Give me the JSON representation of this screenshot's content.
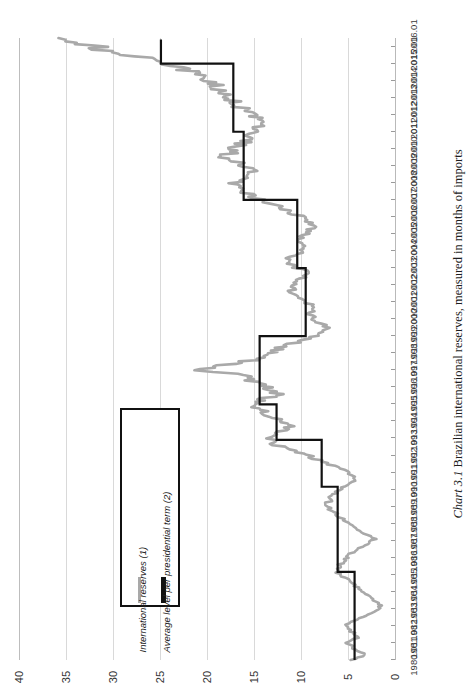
{
  "caption": {
    "label": "Chart 3.1",
    "text": "Brazilian international reserves, measured in months of imports"
  },
  "legend": {
    "position": "inside-left",
    "entries": [
      {
        "name": "International reserves (1)",
        "color": "#a9a9a9",
        "marker": "line-thin"
      },
      {
        "name": "Average level per presidential term (2)",
        "color": "#111111",
        "marker": "line-thick"
      }
    ]
  },
  "chart_data": {
    "type": "line",
    "title": "Brazilian international reserves, measured in months of imports",
    "orientation": "rotated-90ccw",
    "xlabel": "",
    "ylabel": "",
    "ylim": [
      0,
      40
    ],
    "yticks": [
      0,
      5,
      10,
      15,
      20,
      25,
      30,
      35,
      40
    ],
    "grid": "value-axis-gridlines-only",
    "xlim": [
      "1980.01",
      "2016.06"
    ],
    "xticks": [
      "1980.01",
      "1981.01",
      "1982.01",
      "1983.01",
      "1984.01",
      "1985.01",
      "1986.01",
      "1987.01",
      "1988.01",
      "1989.01",
      "1990.01",
      "1991.01",
      "1992.01",
      "1993.01",
      "1994.01",
      "1995.01",
      "1996.01",
      "1997.01",
      "1998.01",
      "1999.01",
      "2000.01",
      "2001.01",
      "2002.01",
      "2003.01",
      "2004.01",
      "2005.01",
      "2006.01",
      "2007.01",
      "2008.01",
      "2009.01",
      "2010.01",
      "2011.01",
      "2012.01",
      "2013.01",
      "2014.01",
      "2015.01",
      "2016.01"
    ],
    "series": [
      {
        "name": "International reserves (1)",
        "color": "#a9a9a9",
        "width": 2.6,
        "x": [
          1980.0,
          1980.3,
          1980.6,
          1981.0,
          1981.3,
          1981.6,
          1982.0,
          1982.3,
          1982.6,
          1982.9,
          1983.2,
          1983.5,
          1983.8,
          1984.1,
          1984.5,
          1984.9,
          1985.2,
          1985.6,
          1986.0,
          1986.4,
          1986.8,
          1987.1,
          1987.5,
          1987.9,
          1988.2,
          1988.6,
          1989.0,
          1989.4,
          1989.8,
          1990.2,
          1990.6,
          1991.0,
          1991.4,
          1991.8,
          1992.2,
          1992.6,
          1993.0,
          1993.4,
          1993.8,
          1994.2,
          1994.6,
          1995.0,
          1995.3,
          1995.6,
          1996.0,
          1996.4,
          1996.8,
          1997.0,
          1997.3,
          1997.6,
          1998.0,
          1998.4,
          1998.8,
          1999.1,
          1999.5,
          1999.9,
          2000.3,
          2000.7,
          2001.1,
          2001.5,
          2001.9,
          2002.3,
          2002.7,
          2003.1,
          2003.5,
          2003.9,
          2004.3,
          2004.7,
          2005.1,
          2005.5,
          2005.9,
          2006.3,
          2006.7,
          2007.1,
          2007.5,
          2007.9,
          2008.3,
          2008.7,
          2009.1,
          2009.5,
          2009.9,
          2010.3,
          2010.7,
          2011.1,
          2011.5,
          2011.9,
          2012.3,
          2012.7,
          2013.1,
          2013.5,
          2013.9,
          2014.3,
          2014.7,
          2015.1,
          2015.5,
          2015.9,
          2016.3,
          2016.5
        ],
        "y": [
          4.6,
          3.2,
          4.1,
          5.1,
          4.0,
          4.5,
          5.3,
          4.3,
          3.1,
          2.0,
          1.5,
          2.2,
          3.0,
          3.6,
          4.6,
          5.5,
          6.2,
          5.8,
          5.2,
          4.4,
          3.0,
          2.2,
          3.4,
          4.6,
          5.4,
          6.4,
          7.2,
          7.0,
          6.4,
          5.2,
          4.2,
          5.0,
          6.6,
          8.4,
          10.2,
          12.4,
          13.6,
          12.2,
          11.0,
          12.6,
          14.2,
          15.6,
          14.0,
          12.4,
          13.8,
          15.2,
          16.6,
          21.8,
          18.2,
          15.0,
          13.4,
          11.8,
          9.6,
          8.0,
          7.2,
          8.4,
          9.2,
          8.6,
          9.8,
          10.6,
          11.2,
          10.2,
          9.2,
          10.8,
          11.4,
          10.2,
          9.4,
          10.0,
          9.2,
          8.6,
          9.6,
          11.2,
          12.8,
          14.6,
          16.4,
          17.2,
          16.0,
          14.8,
          16.2,
          18.0,
          17.4,
          16.2,
          15.4,
          14.6,
          14.2,
          15.0,
          16.2,
          17.0,
          17.8,
          18.6,
          19.4,
          20.8,
          22.4,
          24.6,
          28.0,
          31.6,
          34.4,
          35.8
        ]
      },
      {
        "name": "Average level per presidential term (2)",
        "color": "#111111",
        "width": 2.2,
        "style": "step",
        "segments": [
          {
            "from": "1980.01",
            "to": "1985.03",
            "value": 4.3,
            "term": "Figueiredo"
          },
          {
            "from": "1985.03",
            "to": "1990.03",
            "value": 6.1,
            "term": "Sarney"
          },
          {
            "from": "1990.03",
            "to": "1992.12",
            "value": 7.8,
            "term": "Collor"
          },
          {
            "from": "1992.12",
            "to": "1995.01",
            "value": 12.6,
            "term": "Itamar Franco"
          },
          {
            "from": "1995.01",
            "to": "1999.01",
            "value": 14.4,
            "term": "FHC I"
          },
          {
            "from": "1999.01",
            "to": "2003.01",
            "value": 9.5,
            "term": "FHC II"
          },
          {
            "from": "2003.01",
            "to": "2007.01",
            "value": 10.4,
            "term": "Lula I"
          },
          {
            "from": "2007.01",
            "to": "2011.01",
            "value": 16.1,
            "term": "Lula II"
          },
          {
            "from": "2011.01",
            "to": "2015.01",
            "value": 17.2,
            "term": "Dilma I"
          },
          {
            "from": "2015.01",
            "to": "2016.06",
            "value": 24.9,
            "term": "Dilma II"
          }
        ]
      }
    ]
  },
  "value_axis": {
    "ticks": [
      "40",
      "35",
      "30",
      "25",
      "20",
      "15",
      "10",
      "5",
      "0"
    ]
  },
  "time_axis": {
    "ticks": [
      "2016.01",
      "2015.01",
      "2014.01",
      "2013.01",
      "2012.01",
      "2011.01",
      "2010.01",
      "2009.01",
      "2008.01",
      "2007.01",
      "2006.01",
      "2005.01",
      "2004.01",
      "2003.01",
      "2002.01",
      "2001.01",
      "2000.01",
      "1999.01",
      "1998.01",
      "1997.01",
      "1996.01",
      "1995.01",
      "1994.01",
      "1993.01",
      "1992.01",
      "1991.01",
      "1990.01",
      "1989.01",
      "1988.01",
      "1987.01",
      "1986.01",
      "1985.01",
      "1984.01",
      "1983.01",
      "1982.01",
      "1981.01",
      "1980.01"
    ]
  }
}
